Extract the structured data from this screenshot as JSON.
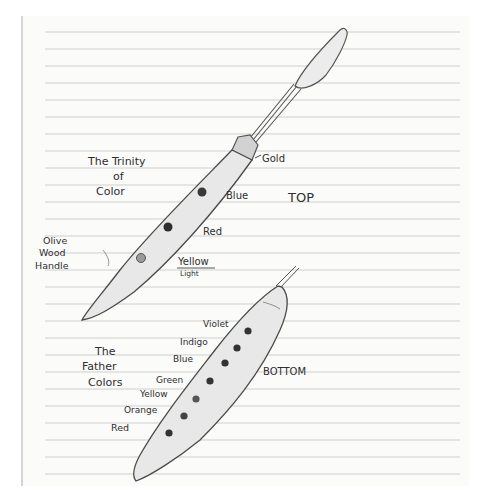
{
  "paper": {
    "background": "#fbfbfa",
    "rule_color": "#c9c9c9",
    "margin_color": "#bdbdbd",
    "rule_first_y": 32,
    "rule_spacing": 17,
    "rule_count": 27,
    "rule_x_start": 45,
    "rule_x_end": 460
  },
  "top_knife": {
    "caption": "TOP",
    "title_lines": [
      "The Trinity",
      "of",
      "Color"
    ],
    "ferrule_label": "Gold",
    "handle_label_lines": [
      "Olive",
      "Wood",
      "Handle"
    ],
    "wells": [
      {
        "label": "Blue",
        "sub": ""
      },
      {
        "label": "Red",
        "sub": ""
      },
      {
        "label": "Yellow",
        "sub": "Light"
      }
    ]
  },
  "bottom_knife": {
    "caption": "BOTTOM",
    "title_lines": [
      "The",
      "Father",
      "Colors"
    ],
    "wells": [
      {
        "label": "Violet"
      },
      {
        "label": "Indigo"
      },
      {
        "label": "Blue"
      },
      {
        "label": "Green"
      },
      {
        "label": "Yellow"
      },
      {
        "label": "Orange"
      },
      {
        "label": "Red"
      }
    ]
  },
  "colors": {
    "ink": "#2e2e2e",
    "pencil": "#555555",
    "shade": "#e6e6e6",
    "dot": "#3a3a3a"
  }
}
